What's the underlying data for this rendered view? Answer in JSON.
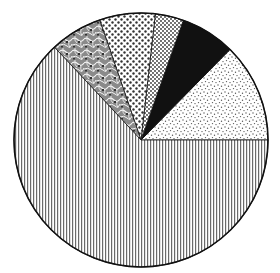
{
  "chart_data": {
    "type": "pie",
    "title": "",
    "start_angle_deg": 0,
    "direction": "counterclockwise",
    "center": [
      141,
      140
    ],
    "radius": 127,
    "slices": [
      {
        "label": "fine-stipple",
        "pattern": "fine-dots",
        "angle_deg": 45.5,
        "percent": 12.6
      },
      {
        "label": "solid-black",
        "pattern": "solid",
        "angle_deg": 25.0,
        "percent": 6.9
      },
      {
        "label": "small-dots",
        "pattern": "small-dots",
        "angle_deg": 13.0,
        "percent": 3.6
      },
      {
        "label": "medium-dots",
        "pattern": "medium-dots",
        "angle_deg": 25.5,
        "percent": 7.1
      },
      {
        "label": "leafy-texture",
        "pattern": "leafy",
        "angle_deg": 24.0,
        "percent": 6.7
      },
      {
        "label": "vertical-stripes",
        "pattern": "vertical-lines",
        "angle_deg": 227.0,
        "percent": 63.1
      }
    ],
    "legend": [],
    "colors": {
      "ink": "#111111",
      "stripe": "#666666",
      "background": "#ffffff"
    }
  }
}
